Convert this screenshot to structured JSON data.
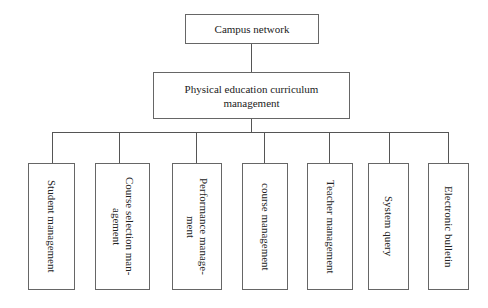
{
  "diagram": {
    "type": "hierarchy",
    "root": {
      "label": "Campus network"
    },
    "level2": {
      "label": "Physical education curriculum\nmanagement"
    },
    "children": [
      {
        "label": "Student management",
        "display": "Student management"
      },
      {
        "label": "Course selection management",
        "display": "Course selection man-\nagement"
      },
      {
        "label": "Performance management",
        "display": "Performance manage-\nment"
      },
      {
        "label": "course management",
        "display": "course management"
      },
      {
        "label": "Teacher management",
        "display": "Teacher management"
      },
      {
        "label": "System query",
        "display": "System query"
      },
      {
        "label": "Electronic bulletin",
        "display": "Electronic bulletin"
      }
    ]
  }
}
